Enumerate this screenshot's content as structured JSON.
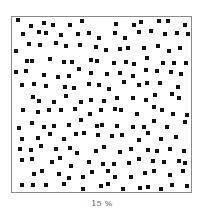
{
  "figure": {
    "caption": "15 %",
    "dot_color": "#111111",
    "border_color": "#8a8a8a",
    "dot_size": 4,
    "grid": {
      "cols": 14,
      "rows": 14,
      "spacing": 12.7,
      "jitter": 4
    }
  }
}
